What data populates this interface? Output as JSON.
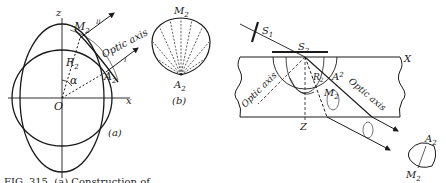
{
  "figure": {
    "panel_a": {
      "label": "(a)",
      "axis_x": "x",
      "axis_z": "z",
      "origin": "O",
      "angle": "α",
      "radius": "R",
      "radius_sub": "2",
      "point_M": "M",
      "point_M_sub": "2",
      "point_A": "A",
      "point_A_sub": "2",
      "ray_II": "II",
      "ray_I": "I",
      "optic_axis": "Optic axis"
    },
    "panel_b": {
      "label": "(b)",
      "point_M": "M",
      "point_M_sub": "2",
      "point_A": "A",
      "point_A_sub": "2"
    },
    "panel_c": {
      "screen_1": "S",
      "screen_1_sub": "1",
      "screen_2": "S",
      "screen_2_sub": "2",
      "axis_X": "X",
      "axis_Z": "Z",
      "radius": "R",
      "radius_sub": "2",
      "point_A": "A",
      "point_A_sub": "2",
      "point_M": "M",
      "point_M_sub": "2",
      "optic_axis_left": "Optic axis",
      "optic_axis_right": "Optic axis",
      "inset_A": "A",
      "inset_A_sub": "2",
      "inset_M": "M",
      "inset_M_sub": "2"
    },
    "caption": "FIG. 315. (a) Construction of"
  }
}
